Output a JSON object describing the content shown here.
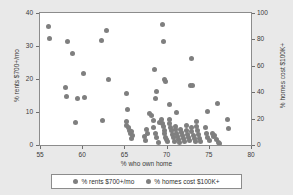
{
  "chart_data": {
    "type": "scatter",
    "title": "",
    "xlabel": "% who own home",
    "ylabel_left": "% rents $700+/mo",
    "ylabel_right": "% homes cost $100K+",
    "xlim": [
      55,
      80
    ],
    "ylim_left": [
      0,
      40
    ],
    "ylim_right": [
      0,
      100
    ],
    "xticks": [
      "55",
      "60",
      "65",
      "70",
      "75",
      "80"
    ],
    "yticks_left": [
      "0",
      "10",
      "20",
      "30",
      "40"
    ],
    "yticks_right": [
      "0",
      "20",
      "40",
      "60",
      "80",
      "100"
    ],
    "grid": false,
    "legend_position": "bottom",
    "series": [
      {
        "name": "% rents $700+/mo",
        "axis": "left",
        "color": "#7f7f7f",
        "marker": "circle",
        "points": [
          [
            56.0,
            35.8
          ],
          [
            56.1,
            32.4
          ],
          [
            58.2,
            31.3
          ],
          [
            58.0,
            17.5
          ],
          [
            58.1,
            14.8
          ],
          [
            58.8,
            27.7
          ],
          [
            59.2,
            6.9
          ],
          [
            59.5,
            14.2
          ],
          [
            60.2,
            21.7
          ],
          [
            60.3,
            14.3
          ],
          [
            62.3,
            31.7
          ],
          [
            62.4,
            7.4
          ],
          [
            62.9,
            34.8
          ],
          [
            63.1,
            19.9
          ],
          [
            65.2,
            15.6
          ],
          [
            65.4,
            10.9
          ],
          [
            68.6,
            23.0
          ],
          [
            68.8,
            16.2
          ],
          [
            68.7,
            14.2
          ],
          [
            69.5,
            36.6
          ],
          [
            69.6,
            31.5
          ],
          [
            69.8,
            19.8
          ],
          [
            69.9,
            19.2
          ],
          [
            70.3,
            12.2
          ],
          [
            71.2,
            9.8
          ],
          [
            72.9,
            26.1
          ],
          [
            72.8,
            18.1
          ],
          [
            73.1,
            17.9
          ],
          [
            74.9,
            10.3
          ],
          [
            76.0,
            12.6
          ],
          [
            77.2,
            7.7
          ],
          [
            77.3,
            4.9
          ]
        ]
      },
      {
        "name": "% homes cost $100K+",
        "axis": "right",
        "color": "#7f7f7f",
        "marker": "circle",
        "points": [
          [
            65.2,
            18.0
          ],
          [
            65.3,
            14.5
          ],
          [
            65.5,
            13.0
          ],
          [
            65.6,
            11.0
          ],
          [
            65.7,
            9.0
          ],
          [
            65.9,
            10.5
          ],
          [
            67.6,
            12.0
          ],
          [
            67.7,
            8.5
          ],
          [
            68.0,
            24.0
          ],
          [
            68.2,
            22.0
          ],
          [
            68.4,
            18.5
          ],
          [
            68.5,
            13.0
          ],
          [
            68.7,
            9.0
          ],
          [
            68.8,
            5.5
          ],
          [
            69.0,
            2.0
          ],
          [
            69.2,
            17.0
          ],
          [
            69.4,
            19.5
          ],
          [
            69.5,
            16.5
          ],
          [
            69.6,
            14.0
          ],
          [
            69.7,
            11.0
          ],
          [
            69.8,
            8.5
          ],
          [
            69.9,
            6.0
          ],
          [
            70.0,
            4.0
          ],
          [
            70.1,
            2.5
          ],
          [
            70.3,
            19.0
          ],
          [
            70.4,
            16.0
          ],
          [
            70.5,
            13.5
          ],
          [
            70.6,
            11.0
          ],
          [
            70.7,
            8.0
          ],
          [
            70.8,
            5.5
          ],
          [
            70.9,
            3.0
          ],
          [
            71.0,
            14.0
          ],
          [
            71.1,
            11.5
          ],
          [
            71.2,
            9.0
          ],
          [
            71.3,
            6.5
          ],
          [
            71.4,
            4.0
          ],
          [
            71.5,
            2.0
          ],
          [
            71.7,
            12.0
          ],
          [
            71.8,
            9.5
          ],
          [
            71.9,
            7.0
          ],
          [
            72.0,
            5.0
          ],
          [
            72.1,
            3.0
          ],
          [
            72.3,
            15.0
          ],
          [
            72.4,
            11.0
          ],
          [
            72.5,
            8.0
          ],
          [
            72.6,
            5.5
          ],
          [
            72.7,
            3.5
          ],
          [
            72.9,
            13.0
          ],
          [
            73.0,
            10.0
          ],
          [
            73.2,
            7.5
          ],
          [
            73.3,
            5.0
          ],
          [
            73.4,
            3.0
          ],
          [
            73.5,
            17.5
          ],
          [
            73.6,
            14.0
          ],
          [
            73.7,
            11.0
          ],
          [
            73.8,
            8.0
          ],
          [
            73.9,
            5.0
          ],
          [
            74.0,
            2.5
          ],
          [
            74.6,
            13.0
          ],
          [
            74.7,
            9.0
          ],
          [
            74.9,
            6.0
          ],
          [
            75.1,
            3.5
          ],
          [
            75.4,
            8.5
          ],
          [
            75.5,
            6.5
          ],
          [
            75.7,
            7.0
          ],
          [
            75.9,
            4.5
          ],
          [
            76.1,
            2.0
          ],
          [
            76.3,
            1.0
          ],
          [
            67.5,
            3.5
          ],
          [
            67.4,
            6.5
          ],
          [
            66.0,
            7.5
          ],
          [
            65.8,
            5.0
          ]
        ]
      }
    ]
  },
  "legend": {
    "items": [
      {
        "label": "% rents $700+/mo"
      },
      {
        "label": "% homes cost $100K+"
      }
    ]
  }
}
